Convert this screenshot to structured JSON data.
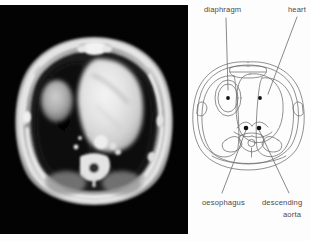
{
  "figure": {
    "type": "medical-anatomy-figure",
    "panels": {
      "ct_scan": {
        "name": "axial-ct-thorax",
        "background_color": "#030303",
        "modality": "CT",
        "plane": "axial",
        "region": "thorax"
      },
      "schematic": {
        "name": "labelled-line-drawing",
        "background_color": "#fdfdfd",
        "line_color": "#6b6b6b"
      }
    }
  },
  "labels": {
    "diaphragm": "diaphragm",
    "heart": "heart",
    "oesophagus": "oesophagus",
    "descending": "descending",
    "aorta": "aorta"
  },
  "annotations": [
    {
      "id": "diaphragm",
      "label": "diaphragm",
      "marker": "dot",
      "marker_color": "#111111",
      "leader_from": [
        36,
        18
      ],
      "leader_to": [
        38,
        92
      ],
      "marker_at": [
        38,
        92
      ]
    },
    {
      "id": "heart",
      "label": "heart",
      "marker": "dot",
      "marker_color": "#111111",
      "leader_from": [
        107,
        17
      ],
      "leader_to": [
        78,
        96
      ],
      "marker_at": [
        78,
        96
      ]
    },
    {
      "id": "oesophagus",
      "label": "oesophagus",
      "marker": "dot",
      "marker_color": "#111111",
      "leader_from": [
        32,
        193
      ],
      "leader_to": [
        56,
        128
      ],
      "marker_at": [
        56,
        128
      ]
    },
    {
      "id": "descending-aorta",
      "label": "descending aorta",
      "marker": "dot",
      "marker_color": "#111111",
      "leader_from": [
        99,
        193
      ],
      "leader_to": [
        69,
        128
      ],
      "marker_at": [
        69,
        128
      ]
    }
  ],
  "colors": {
    "page_background": "#ffffff",
    "ct_background": "#030303",
    "diagram_background": "#fdfdfd",
    "diagram_stroke": "#6b6b6b",
    "label_text": "#4a4a4a",
    "marker": "#111111"
  }
}
